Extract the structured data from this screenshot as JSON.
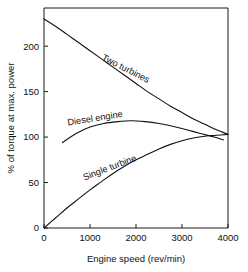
{
  "chart_data": {
    "type": "line",
    "title": "",
    "subtitle": "",
    "xlabel": "Engine speed (rev/min)",
    "ylabel": "% of torque at max. power",
    "xlim": [
      0,
      4000
    ],
    "ylim": [
      0,
      242
    ],
    "xticks": [
      0,
      1000,
      2000,
      3000,
      4000
    ],
    "xtick_labels": [
      "0",
      "1000",
      "2000",
      "3000",
      "4000"
    ],
    "yticks": [
      0,
      50,
      100,
      150,
      200
    ],
    "ytick_labels": [
      "0",
      "50",
      "100",
      "150",
      "200"
    ],
    "grid": false,
    "legend_position": "inline-curve-labels",
    "series": [
      {
        "name": "Two turbines",
        "label": "Two turbines",
        "x": [
          0,
          250,
          500,
          750,
          1000,
          1250,
          1500,
          1750,
          2000,
          2250,
          2500,
          2750,
          3000,
          3250,
          3500,
          3750,
          4000
        ],
        "values": [
          230,
          222,
          213,
          204,
          195,
          186,
          177,
          168,
          159,
          150,
          142,
          134,
          127,
          120,
          114,
          108,
          103
        ]
      },
      {
        "name": "Diesel engine",
        "label": "Diesel engine",
        "x": [
          400,
          700,
          1000,
          1300,
          1600,
          1900,
          2200,
          2500,
          2800,
          3100,
          3400,
          3700,
          3900
        ],
        "values": [
          94,
          104,
          111,
          115,
          117,
          118,
          117,
          115,
          112,
          108,
          104,
          100,
          97
        ]
      },
      {
        "name": "Single turbine",
        "label": "Single turbine",
        "x": [
          0,
          250,
          500,
          750,
          1000,
          1250,
          1500,
          1750,
          2000,
          2250,
          2500,
          2750,
          3000,
          3250,
          3500,
          3750,
          4000
        ],
        "values": [
          0,
          11,
          22,
          32,
          42,
          51,
          60,
          68,
          75,
          81,
          87,
          92,
          96,
          99,
          101,
          102,
          103
        ]
      }
    ],
    "annotations": [
      {
        "text": "Two turbines",
        "series": "Two turbines",
        "angle": 27
      },
      {
        "text": "Diesel engine",
        "series": "Diesel engine",
        "angle": -9
      },
      {
        "text": "Single turbine",
        "series": "Single turbine",
        "angle": -21
      }
    ]
  }
}
